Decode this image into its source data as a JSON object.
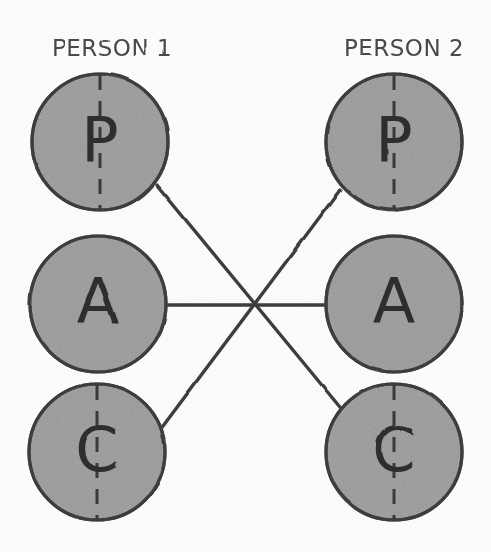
{
  "canvas": {
    "width": 491,
    "height": 552,
    "background_color": "#fcfcfb"
  },
  "style": {
    "circle_fill": "#9a9a9a",
    "circle_stroke": "#3d3d3d",
    "line_color": "#3d3d3d",
    "letter_color": "#2f2f2f",
    "label_color": "#4a4a4a",
    "dash_color": "#3a3a3a",
    "circle_radius": 68,
    "stroke_width": 3.2,
    "connector_width": 3.4
  },
  "columns": [
    {
      "id": "person-1",
      "label": "PERSON 1",
      "label_x": 112,
      "label_y": 56,
      "center_x": 99,
      "ego_states": [
        {
          "id": "p1-parent",
          "letter": "P",
          "name": "parent",
          "cx": 100,
          "cy": 142,
          "has_dashed_axis": true
        },
        {
          "id": "p1-adult",
          "letter": "A",
          "name": "adult",
          "cx": 98,
          "cy": 304,
          "has_dashed_axis": false
        },
        {
          "id": "p1-child",
          "letter": "C",
          "name": "child",
          "cx": 97,
          "cy": 452,
          "has_dashed_axis": true
        }
      ]
    },
    {
      "id": "person-2",
      "label": "PERSON 2",
      "label_x": 404,
      "label_y": 56,
      "center_x": 394,
      "ego_states": [
        {
          "id": "p2-parent",
          "letter": "P",
          "name": "parent",
          "cx": 394,
          "cy": 142,
          "has_dashed_axis": true
        },
        {
          "id": "p2-adult",
          "letter": "A",
          "name": "adult",
          "cx": 394,
          "cy": 304,
          "has_dashed_axis": false
        },
        {
          "id": "p2-child",
          "letter": "C",
          "name": "child",
          "cx": 394,
          "cy": 452,
          "has_dashed_axis": true
        }
      ]
    }
  ],
  "crossing_point": {
    "x": 254,
    "y": 306
  },
  "connectors": [
    {
      "id": "adult-to-adult",
      "name": "adult-adult-line",
      "from": "p1-adult",
      "to": "p2-adult",
      "x1": 166,
      "y1": 305,
      "x2": 326,
      "y2": 305
    },
    {
      "id": "p1-parent-to-p2-child",
      "name": "parent1-child2-line",
      "from": "p1-parent",
      "to": "p2-child",
      "x1": 157,
      "y1": 185,
      "x2": 344,
      "y2": 412
    },
    {
      "id": "p1-child-to-p2-parent",
      "name": "child1-parent2-line",
      "from": "p1-child",
      "to": "p2-parent",
      "x1": 160,
      "y1": 430,
      "x2": 340,
      "y2": 190
    }
  ]
}
